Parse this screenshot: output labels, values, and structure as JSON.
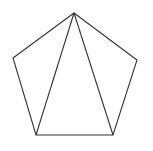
{
  "diagram": {
    "title": "",
    "shape": "pentagon",
    "stroke_color": "#333333",
    "background_color": "#ffffff",
    "vertices": {
      "top": {
        "x": 74,
        "y": 13
      },
      "left": {
        "x": 13,
        "y": 58
      },
      "right": {
        "x": 137,
        "y": 60
      },
      "bottom_left": {
        "x": 36,
        "y": 135
      },
      "bottom_right": {
        "x": 113,
        "y": 135
      }
    },
    "edges": [
      {
        "from": "top",
        "to": "left",
        "kind": "side"
      },
      {
        "from": "left",
        "to": "bottom_left",
        "kind": "side"
      },
      {
        "from": "bottom_left",
        "to": "bottom_right",
        "kind": "side"
      },
      {
        "from": "bottom_right",
        "to": "right",
        "kind": "side"
      },
      {
        "from": "right",
        "to": "top",
        "kind": "side"
      },
      {
        "from": "top",
        "to": "bottom_left",
        "kind": "diagonal"
      },
      {
        "from": "top",
        "to": "bottom_right",
        "kind": "diagonal"
      }
    ]
  }
}
